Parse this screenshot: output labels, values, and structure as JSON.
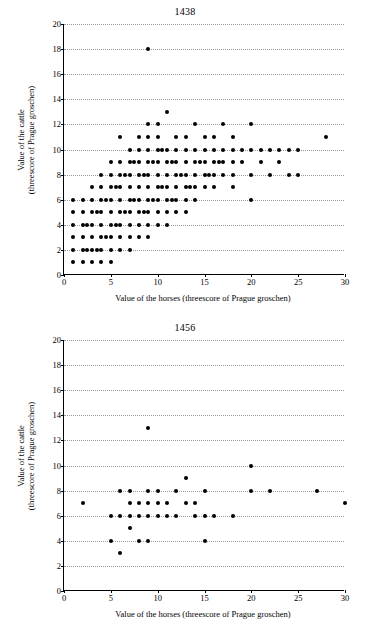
{
  "chart_data": [
    {
      "type": "scatter",
      "title": "1438",
      "xlabel": "Value of the horses (threescore of Prague groschen)",
      "ylabel": "Value of the cattle (threescore of Prague groschen)",
      "xlim": [
        0,
        30
      ],
      "ylim": [
        0,
        20
      ],
      "xticks": [
        0,
        5,
        10,
        15,
        20,
        25,
        30
      ],
      "yticks": [
        0,
        2,
        4,
        6,
        8,
        10,
        12,
        14,
        16,
        18,
        20
      ],
      "grid": "horizontal-dotted",
      "legend": "none",
      "points": [
        [
          1,
          1
        ],
        [
          1,
          2
        ],
        [
          1,
          3
        ],
        [
          1,
          4
        ],
        [
          1,
          5
        ],
        [
          1,
          6
        ],
        [
          2,
          1
        ],
        [
          2,
          2
        ],
        [
          2,
          3
        ],
        [
          2,
          4
        ],
        [
          2,
          5
        ],
        [
          2,
          6
        ],
        [
          2.5,
          2
        ],
        [
          2.5,
          4
        ],
        [
          3,
          1
        ],
        [
          3,
          2
        ],
        [
          3,
          3
        ],
        [
          3,
          4
        ],
        [
          3,
          5
        ],
        [
          3,
          6
        ],
        [
          3,
          7
        ],
        [
          3.5,
          2
        ],
        [
          3.5,
          5
        ],
        [
          4,
          1
        ],
        [
          4,
          2
        ],
        [
          4,
          3
        ],
        [
          4,
          4
        ],
        [
          4,
          5
        ],
        [
          4,
          6
        ],
        [
          4,
          7
        ],
        [
          4,
          8
        ],
        [
          4.5,
          3
        ],
        [
          4.5,
          6
        ],
        [
          5,
          1
        ],
        [
          5,
          2
        ],
        [
          5,
          3
        ],
        [
          5,
          4
        ],
        [
          5,
          5
        ],
        [
          5,
          6
        ],
        [
          5,
          7
        ],
        [
          5,
          8
        ],
        [
          5,
          9
        ],
        [
          5.5,
          4
        ],
        [
          5.5,
          7
        ],
        [
          6,
          2
        ],
        [
          6,
          3
        ],
        [
          6,
          4
        ],
        [
          6,
          5
        ],
        [
          6,
          6
        ],
        [
          6,
          7
        ],
        [
          6,
          8
        ],
        [
          6,
          9
        ],
        [
          6,
          11
        ],
        [
          6.5,
          5
        ],
        [
          6.5,
          8
        ],
        [
          7,
          2
        ],
        [
          7,
          3
        ],
        [
          7,
          4
        ],
        [
          7,
          5
        ],
        [
          7,
          6
        ],
        [
          7,
          7
        ],
        [
          7,
          8
        ],
        [
          7,
          9
        ],
        [
          7,
          10
        ],
        [
          7.5,
          6
        ],
        [
          7.5,
          9
        ],
        [
          8,
          3
        ],
        [
          8,
          4
        ],
        [
          8,
          5
        ],
        [
          8,
          6
        ],
        [
          8,
          7
        ],
        [
          8,
          8
        ],
        [
          8,
          9
        ],
        [
          8,
          10
        ],
        [
          8,
          11
        ],
        [
          8.5,
          5
        ],
        [
          8.5,
          8
        ],
        [
          9,
          3
        ],
        [
          9,
          4
        ],
        [
          9,
          5
        ],
        [
          9,
          6
        ],
        [
          9,
          7
        ],
        [
          9,
          8
        ],
        [
          9,
          9
        ],
        [
          9,
          10
        ],
        [
          9,
          11
        ],
        [
          9,
          12
        ],
        [
          9,
          18
        ],
        [
          9.5,
          6
        ],
        [
          9.5,
          9
        ],
        [
          10,
          4
        ],
        [
          10,
          5
        ],
        [
          10,
          6
        ],
        [
          10,
          7
        ],
        [
          10,
          8
        ],
        [
          10,
          9
        ],
        [
          10,
          10
        ],
        [
          10,
          11
        ],
        [
          10,
          12
        ],
        [
          10.5,
          7
        ],
        [
          10.5,
          10
        ],
        [
          11,
          4
        ],
        [
          11,
          5
        ],
        [
          11,
          6
        ],
        [
          11,
          7
        ],
        [
          11,
          8
        ],
        [
          11,
          9
        ],
        [
          11,
          10
        ],
        [
          11,
          13
        ],
        [
          11.5,
          6
        ],
        [
          11.5,
          9
        ],
        [
          12,
          5
        ],
        [
          12,
          6
        ],
        [
          12,
          7
        ],
        [
          12,
          8
        ],
        [
          12,
          9
        ],
        [
          12,
          10
        ],
        [
          12,
          11
        ],
        [
          12.5,
          8
        ],
        [
          13,
          5
        ],
        [
          13,
          6
        ],
        [
          13,
          7
        ],
        [
          13,
          8
        ],
        [
          13,
          9
        ],
        [
          13,
          10
        ],
        [
          13,
          11
        ],
        [
          13.5,
          7
        ],
        [
          14,
          6
        ],
        [
          14,
          7
        ],
        [
          14,
          8
        ],
        [
          14,
          9
        ],
        [
          14,
          10
        ],
        [
          14,
          12
        ],
        [
          14.5,
          9
        ],
        [
          15,
          7
        ],
        [
          15,
          8
        ],
        [
          15,
          9
        ],
        [
          15,
          10
        ],
        [
          15,
          11
        ],
        [
          15.5,
          8
        ],
        [
          16,
          7
        ],
        [
          16,
          8
        ],
        [
          16,
          9
        ],
        [
          16,
          10
        ],
        [
          16,
          11
        ],
        [
          16.5,
          9
        ],
        [
          17,
          8
        ],
        [
          17,
          9
        ],
        [
          17,
          10
        ],
        [
          17,
          12
        ],
        [
          18,
          7
        ],
        [
          18,
          8
        ],
        [
          18,
          9
        ],
        [
          18,
          10
        ],
        [
          18,
          11
        ],
        [
          19,
          9
        ],
        [
          19,
          10
        ],
        [
          20,
          6
        ],
        [
          20,
          8
        ],
        [
          20,
          10
        ],
        [
          20,
          12
        ],
        [
          21,
          9
        ],
        [
          21,
          10
        ],
        [
          22,
          8
        ],
        [
          22,
          10
        ],
        [
          23,
          9
        ],
        [
          23,
          10
        ],
        [
          24,
          8
        ],
        [
          24,
          10
        ],
        [
          25,
          8
        ],
        [
          25,
          10
        ],
        [
          28,
          11
        ]
      ]
    },
    {
      "type": "scatter",
      "title": "1456",
      "xlabel": "Value of the horses (threescore of Prague groschen)",
      "ylabel": "Value of the cattle (threescore of Prague groschen)",
      "xlim": [
        0,
        30
      ],
      "ylim": [
        0,
        20
      ],
      "xticks": [
        0,
        5,
        10,
        15,
        20,
        25,
        30
      ],
      "yticks": [
        0,
        2,
        4,
        6,
        8,
        10,
        12,
        14,
        16,
        18,
        20
      ],
      "grid": "horizontal-dotted",
      "legend": "none",
      "points": [
        [
          2,
          7
        ],
        [
          5,
          4
        ],
        [
          5,
          6
        ],
        [
          6,
          3
        ],
        [
          6,
          6
        ],
        [
          6,
          8
        ],
        [
          7,
          5
        ],
        [
          7,
          6
        ],
        [
          7,
          7
        ],
        [
          7,
          8
        ],
        [
          8,
          4
        ],
        [
          8,
          6
        ],
        [
          8,
          7
        ],
        [
          9,
          4
        ],
        [
          9,
          6
        ],
        [
          9,
          7
        ],
        [
          9,
          8
        ],
        [
          9,
          13
        ],
        [
          10,
          6
        ],
        [
          10,
          7
        ],
        [
          10,
          8
        ],
        [
          11,
          6
        ],
        [
          11,
          7
        ],
        [
          12,
          6
        ],
        [
          12,
          8
        ],
        [
          13,
          7
        ],
        [
          13,
          9
        ],
        [
          14,
          6
        ],
        [
          14,
          7
        ],
        [
          15,
          4
        ],
        [
          15,
          6
        ],
        [
          15,
          8
        ],
        [
          16,
          6
        ],
        [
          18,
          6
        ],
        [
          20,
          8
        ],
        [
          20,
          10
        ],
        [
          22,
          8
        ],
        [
          27,
          8
        ],
        [
          30,
          7
        ]
      ]
    }
  ]
}
